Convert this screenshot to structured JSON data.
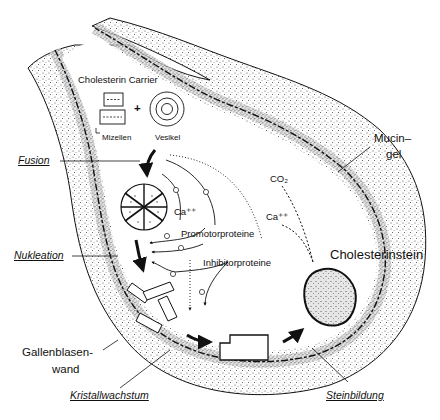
{
  "diagram": {
    "labels": {
      "carrier": "Cholesterin Carrier",
      "micelles": "Mizellen",
      "vesicle": "Vesikel",
      "plus": "+",
      "fusion": "Fusion",
      "nucleation": "Nukleation",
      "crystal_growth": "Kristallwachstum",
      "stone_formation": "Steinbildung",
      "ca1": "Ca⁺⁺",
      "ca2": "Ca⁺⁺",
      "co2": "CO₂",
      "promoter": "Promotorproteine",
      "inhibitor": "Inhibitorproteine",
      "mucin_line1": "Mucin–",
      "mucin_line2": "gel",
      "stone": "Cholesterinstein",
      "wall_line1": "Gallenblasen-",
      "wall_line2": "wand"
    },
    "stages": [
      "Fusion",
      "Nukleation",
      "Kristallwachstum",
      "Steinbildung"
    ],
    "signs": {
      "promoter_effect": "+",
      "inhibitor_effect": "−"
    },
    "colors": {
      "ink": "#111111",
      "stipple": "#555555",
      "background": "#ffffff"
    }
  }
}
